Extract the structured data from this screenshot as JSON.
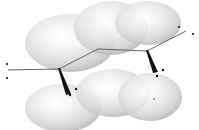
{
  "diagram": {
    "title": "Molecular orbital lobes with bond skeleton",
    "width": 199,
    "height": 130,
    "colors": {
      "background": "#ffffff",
      "lobe_highlight": "#ffffff",
      "lobe_mid": "#e4e4e4",
      "lobe_shadow": "#a8a8a8",
      "bond": "#555555",
      "wedge": "#111111",
      "dot": "#111111"
    },
    "lobes": [
      {
        "id": "top-left",
        "cx": 70,
        "cy": 43,
        "rx": 45,
        "ry": 29
      },
      {
        "id": "top-middle",
        "cx": 111,
        "cy": 28,
        "rx": 37,
        "ry": 27
      },
      {
        "id": "top-right",
        "cx": 148,
        "cy": 23,
        "rx": 33,
        "ry": 22
      },
      {
        "id": "bottom-left",
        "cx": 63,
        "cy": 108,
        "rx": 38,
        "ry": 24
      },
      {
        "id": "bottom-middle",
        "cx": 113,
        "cy": 93,
        "rx": 37,
        "ry": 24
      },
      {
        "id": "bottom-right",
        "cx": 150,
        "cy": 97,
        "rx": 32,
        "ry": 24
      }
    ],
    "bonds": {
      "points": "8,70 59,69 98,49 147,51 186,31"
    },
    "wedges": [
      {
        "id": "wedge-left",
        "points": "58,68 60,68 71,94 66,95"
      },
      {
        "id": "wedge-right",
        "points": "146,50 148,50 158,72 153,73"
      }
    ],
    "dots": [
      {
        "id": "left-end-top",
        "cx": 7,
        "cy": 64,
        "r": 1.1
      },
      {
        "id": "left-end-bottom",
        "cx": 7,
        "cy": 78,
        "r": 1.1
      },
      {
        "id": "right-end-top",
        "cx": 179,
        "cy": 27,
        "r": 1.1
      },
      {
        "id": "right-end-bottom",
        "cx": 193,
        "cy": 34,
        "r": 1.1
      },
      {
        "id": "wedge-left-dot-1",
        "cx": 76,
        "cy": 89,
        "r": 1.2
      },
      {
        "id": "wedge-left-dot-2",
        "cx": 70,
        "cy": 95,
        "r": 1.2
      },
      {
        "id": "wedge-right-dot-1",
        "cx": 163,
        "cy": 70,
        "r": 1.2
      },
      {
        "id": "wedge-right-dot-2",
        "cx": 157,
        "cy": 76,
        "r": 1.2
      },
      {
        "id": "stray-dot",
        "cx": 154,
        "cy": 99,
        "r": 0.7
      }
    ]
  }
}
